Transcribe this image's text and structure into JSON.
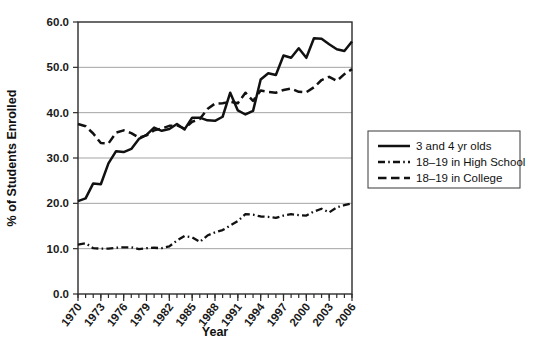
{
  "chart_data": {
    "type": "line",
    "title": "",
    "xlabel": "Year",
    "ylabel": "% of Students Enrolled",
    "xlim": [
      1970,
      2006
    ],
    "ylim": [
      0.0,
      60.0
    ],
    "yticks": [
      "0.0",
      "10.0",
      "20.0",
      "30.0",
      "40.0",
      "50.0",
      "60.0"
    ],
    "ytick_values": [
      0.0,
      10.0,
      20.0,
      30.0,
      40.0,
      50.0,
      60.0
    ],
    "xticks": [
      "1970",
      "1973",
      "1976",
      "1979",
      "1982",
      "1985",
      "1988",
      "1991",
      "1994",
      "1997",
      "2000",
      "2003",
      "2006"
    ],
    "xtick_values": [
      1970,
      1973,
      1976,
      1979,
      1982,
      1985,
      1988,
      1991,
      1994,
      1997,
      2000,
      2003,
      2006
    ],
    "minor_xticks_every": 1,
    "grid": "horizontal",
    "legend_position": "right-outside",
    "x": [
      1970,
      1971,
      1972,
      1973,
      1974,
      1975,
      1976,
      1977,
      1978,
      1979,
      1980,
      1981,
      1982,
      1983,
      1984,
      1985,
      1986,
      1987,
      1988,
      1989,
      1990,
      1991,
      1992,
      1993,
      1994,
      1995,
      1996,
      1997,
      1998,
      1999,
      2000,
      2001,
      2002,
      2003,
      2004,
      2005,
      2006
    ],
    "series": [
      {
        "name": "3 and 4 yr olds",
        "style": "solid",
        "color": "#111111",
        "values": [
          20.5,
          21.1,
          24.4,
          24.2,
          28.8,
          31.5,
          31.3,
          32.0,
          34.2,
          35.1,
          36.7,
          36.0,
          36.4,
          37.5,
          36.3,
          38.9,
          38.9,
          38.3,
          38.2,
          39.1,
          44.4,
          40.5,
          39.6,
          40.4,
          47.3,
          48.7,
          48.3,
          52.6,
          52.1,
          54.2,
          52.1,
          56.4,
          56.3,
          55.1,
          54.0,
          53.6,
          55.7
        ]
      },
      {
        "name": "18–19 in High School",
        "style": "dashdot",
        "color": "#111111",
        "values": [
          10.9,
          11.2,
          10.1,
          10.0,
          10.0,
          10.2,
          10.3,
          10.3,
          9.9,
          10.1,
          10.2,
          10.1,
          10.5,
          11.8,
          12.8,
          12.5,
          11.5,
          12.9,
          13.6,
          14.1,
          15.1,
          16.1,
          17.6,
          17.5,
          17.1,
          17.0,
          16.8,
          17.3,
          17.6,
          17.4,
          17.3,
          18.2,
          18.8,
          18.0,
          19.1,
          19.6,
          20.0
        ]
      },
      {
        "name": "18–19 in College",
        "style": "dashed",
        "color": "#111111",
        "values": [
          37.5,
          37.0,
          35.4,
          33.3,
          33.2,
          35.6,
          36.1,
          35.5,
          34.5,
          35.0,
          36.1,
          36.5,
          37.1,
          37.2,
          36.5,
          38.0,
          38.6,
          40.8,
          42.0,
          42.1,
          42.4,
          42.1,
          44.4,
          42.6,
          44.9,
          44.6,
          44.4,
          45.0,
          45.3,
          44.6,
          44.5,
          45.6,
          47.2,
          47.9,
          47.0,
          48.5,
          49.6
        ]
      }
    ]
  },
  "legend": {
    "entries": [
      {
        "label": "3 and 4 yr olds",
        "style": "solid"
      },
      {
        "label": "18–19 in High School",
        "style": "dashdot"
      },
      {
        "label": "18–19 in College",
        "style": "dashed"
      }
    ]
  },
  "caption": {
    "text": ""
  }
}
